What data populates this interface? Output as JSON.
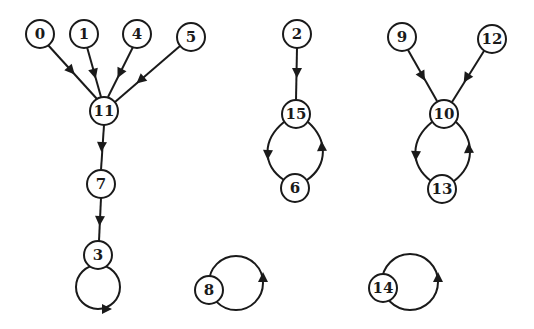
{
  "diagram": {
    "type": "directed-graph",
    "colors": {
      "stroke": "#1a1a1a",
      "background": "#ffffff"
    },
    "nodes": [
      {
        "id": "0",
        "label": "0",
        "x": 40,
        "y": 34
      },
      {
        "id": "1",
        "label": "1",
        "x": 84,
        "y": 34
      },
      {
        "id": "4",
        "label": "4",
        "x": 137,
        "y": 34
      },
      {
        "id": "5",
        "label": "5",
        "x": 191,
        "y": 37
      },
      {
        "id": "11",
        "label": "11",
        "x": 104,
        "y": 111
      },
      {
        "id": "7",
        "label": "7",
        "x": 101,
        "y": 184
      },
      {
        "id": "3",
        "label": "3",
        "x": 98,
        "y": 255
      },
      {
        "id": "2",
        "label": "2",
        "x": 297,
        "y": 34
      },
      {
        "id": "15",
        "label": "15",
        "x": 296,
        "y": 114
      },
      {
        "id": "6",
        "label": "6",
        "x": 295,
        "y": 188
      },
      {
        "id": "9",
        "label": "9",
        "x": 402,
        "y": 37
      },
      {
        "id": "12",
        "label": "12",
        "x": 492,
        "y": 39
      },
      {
        "id": "10",
        "label": "10",
        "x": 444,
        "y": 114
      },
      {
        "id": "13",
        "label": "13",
        "x": 442,
        "y": 189
      },
      {
        "id": "8",
        "label": "8",
        "x": 209,
        "y": 290
      },
      {
        "id": "14",
        "label": "14",
        "x": 383,
        "y": 288
      }
    ],
    "edges": [
      {
        "from": "0",
        "to": "11"
      },
      {
        "from": "1",
        "to": "11"
      },
      {
        "from": "4",
        "to": "11"
      },
      {
        "from": "5",
        "to": "11"
      },
      {
        "from": "11",
        "to": "7"
      },
      {
        "from": "7",
        "to": "3"
      },
      {
        "from": "3",
        "to": "3",
        "kind": "self-loop"
      },
      {
        "from": "2",
        "to": "15"
      },
      {
        "from": "15",
        "to": "6",
        "kind": "curved-left"
      },
      {
        "from": "6",
        "to": "15",
        "kind": "curved-right"
      },
      {
        "from": "9",
        "to": "10"
      },
      {
        "from": "12",
        "to": "10"
      },
      {
        "from": "10",
        "to": "13",
        "kind": "curved-left"
      },
      {
        "from": "13",
        "to": "10",
        "kind": "curved-right"
      },
      {
        "from": "8",
        "to": "8",
        "kind": "self-loop"
      },
      {
        "from": "14",
        "to": "14",
        "kind": "self-loop"
      }
    ]
  }
}
